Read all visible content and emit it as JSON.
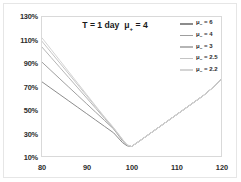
{
  "chart_data": {
    "type": "line",
    "title_main": "T = 1 day",
    "title_mu": "μ",
    "title_sub": "+",
    "title_eq": " = 4",
    "xlabel": "",
    "ylabel": "",
    "xlim": [
      80,
      120
    ],
    "ylim": [
      10,
      130
    ],
    "x_ticks": [
      "80",
      "90",
      "100",
      "110",
      "120"
    ],
    "x_tick_values": [
      80,
      90,
      100,
      110,
      120
    ],
    "y_ticks": [
      "10%",
      "30%",
      "50%",
      "70%",
      "90%",
      "110%",
      "130%"
    ],
    "y_tick_values": [
      10,
      30,
      50,
      70,
      90,
      110,
      130
    ],
    "grid": false,
    "legend_position": "top-right",
    "x": [
      80,
      82,
      84,
      86,
      88,
      90,
      92,
      94,
      96,
      98,
      99,
      100,
      102,
      104,
      106,
      108,
      110,
      112,
      114,
      116,
      118,
      120
    ],
    "series": [
      {
        "name": "μ₋ = 6",
        "label_mu": "μ",
        "label_sub": "−",
        "label_eq": " = 6",
        "color": "#8c8c8c",
        "values": [
          74.0,
          68.5,
          63.0,
          57.5,
          52.0,
          46.5,
          41.0,
          35.5,
          30.0,
          21.5,
          18.8,
          18.2,
          23.5,
          29.0,
          34.5,
          40.0,
          45.5,
          51.0,
          56.5,
          62.0,
          68.5,
          76.0
        ]
      },
      {
        "name": "μ₋ = 4",
        "label_mu": "μ",
        "label_sub": "−",
        "label_eq": " = 4",
        "color": "#9e9e9e",
        "values": [
          91.0,
          83.8,
          76.6,
          69.4,
          62.2,
          55.0,
          47.8,
          40.6,
          33.4,
          23.0,
          19.2,
          18.2,
          23.5,
          29.0,
          34.5,
          40.0,
          45.5,
          51.0,
          56.5,
          62.0,
          68.5,
          76.0
        ]
      },
      {
        "name": "μ₋ = 3",
        "label_mu": "μ",
        "label_sub": "−",
        "label_eq": " = 3",
        "color": "#b5b5b5",
        "values": [
          104.0,
          95.2,
          86.4,
          77.6,
          68.8,
          60.0,
          51.2,
          42.4,
          33.6,
          23.8,
          19.4,
          18.2,
          23.5,
          29.0,
          34.5,
          40.0,
          45.5,
          51.0,
          56.5,
          62.0,
          68.5,
          76.0
        ]
      },
      {
        "name": "μ₋ = 2.5",
        "label_mu": "μ",
        "label_sub": "−",
        "label_eq": " = 2.5",
        "color": "#c4c4c4",
        "values": [
          109.0,
          99.6,
          90.2,
          80.8,
          71.4,
          62.0,
          52.6,
          43.2,
          34.2,
          24.2,
          19.6,
          18.2,
          23.5,
          29.0,
          34.5,
          40.0,
          45.5,
          51.0,
          56.5,
          62.0,
          68.5,
          76.0
        ]
      },
      {
        "name": "μ₋ = 2.2",
        "label_mu": "μ",
        "label_sub": "−",
        "label_eq": " = 2.2",
        "color": "#d4d4d4",
        "values": [
          112.0,
          102.2,
          92.4,
          82.6,
          72.8,
          63.0,
          53.2,
          43.6,
          34.5,
          24.4,
          19.7,
          18.2,
          23.5,
          29.0,
          34.5,
          40.0,
          45.5,
          51.0,
          56.5,
          62.0,
          68.5,
          76.0
        ]
      }
    ]
  }
}
